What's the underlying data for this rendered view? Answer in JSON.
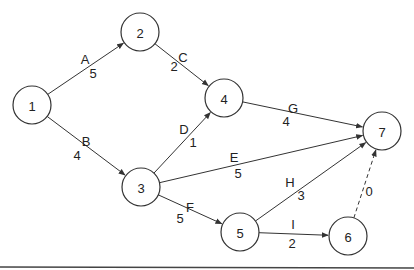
{
  "diagram": {
    "type": "activity-on-arrow network",
    "node_radius": 19,
    "nodes": [
      {
        "id": "1",
        "label": "1",
        "x": 32,
        "y": 105
      },
      {
        "id": "2",
        "label": "2",
        "x": 140,
        "y": 32
      },
      {
        "id": "3",
        "label": "3",
        "x": 141,
        "y": 187
      },
      {
        "id": "4",
        "label": "4",
        "x": 224,
        "y": 98
      },
      {
        "id": "5",
        "label": "5",
        "x": 240,
        "y": 232
      },
      {
        "id": "6",
        "label": "6",
        "x": 348,
        "y": 236
      },
      {
        "id": "7",
        "label": "7",
        "x": 382,
        "y": 131
      }
    ],
    "edges": [
      {
        "activity": "A",
        "duration": "5",
        "from": "1",
        "to": "2",
        "dashed": false,
        "name_pos": [
          85,
          64
        ],
        "dur_pos": [
          93,
          78
        ]
      },
      {
        "activity": "B",
        "duration": "4",
        "from": "1",
        "to": "3",
        "dashed": false,
        "name_pos": [
          86,
          146
        ],
        "dur_pos": [
          77,
          160
        ]
      },
      {
        "activity": "C",
        "duration": "2",
        "from": "2",
        "to": "4",
        "dashed": false,
        "name_pos": [
          183,
          62
        ],
        "dur_pos": [
          174,
          71
        ]
      },
      {
        "activity": "D",
        "duration": "1",
        "from": "3",
        "to": "4",
        "dashed": false,
        "name_pos": [
          184,
          134
        ],
        "dur_pos": [
          193,
          147
        ]
      },
      {
        "activity": "E",
        "duration": "5",
        "from": "3",
        "to": "7",
        "dashed": false,
        "name_pos": [
          234,
          162
        ],
        "dur_pos": [
          238,
          178
        ]
      },
      {
        "activity": "F",
        "duration": "5",
        "from": "3",
        "to": "5",
        "dashed": false,
        "name_pos": [
          190,
          212
        ],
        "dur_pos": [
          180,
          223
        ]
      },
      {
        "activity": "G",
        "duration": "4",
        "from": "4",
        "to": "7",
        "dashed": false,
        "name_pos": [
          293,
          113
        ],
        "dur_pos": [
          286,
          126
        ]
      },
      {
        "activity": "H",
        "duration": "3",
        "from": "5",
        "to": "7",
        "dashed": false,
        "name_pos": [
          290,
          187
        ],
        "dur_pos": [
          301,
          200
        ]
      },
      {
        "activity": "I",
        "duration": "2",
        "from": "5",
        "to": "6",
        "dashed": false,
        "name_pos": [
          293,
          229
        ],
        "dur_pos": [
          292,
          248
        ]
      },
      {
        "activity": "",
        "duration": "0",
        "from": "6",
        "to": "7",
        "dashed": true,
        "name_pos": [
          0,
          0
        ],
        "dur_pos": [
          369,
          196
        ]
      }
    ]
  }
}
